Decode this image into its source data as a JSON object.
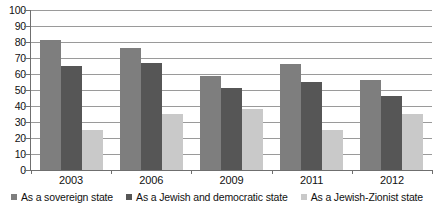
{
  "chart_data": {
    "type": "bar",
    "title": "",
    "subtitle": "",
    "xlabel": "",
    "ylabel": "",
    "categories": [
      "2003",
      "2006",
      "2009",
      "2011",
      "2012"
    ],
    "series": [
      {
        "name": "As a sovereign state",
        "color": "#7e7e7e",
        "values": [
          81,
          76,
          59,
          66,
          56
        ]
      },
      {
        "name": "As a Jewish and democratic state",
        "color": "#565656",
        "values": [
          65,
          67,
          51,
          55,
          46
        ]
      },
      {
        "name": "As a Jewish-Zionist state",
        "color": "#c9c9c9",
        "values": [
          25,
          35,
          38,
          25,
          35
        ]
      }
    ],
    "ylim": [
      0,
      100
    ],
    "ytick_step": 10,
    "yticks": [
      "100",
      "90",
      "80",
      "70",
      "60",
      "50",
      "40",
      "30",
      "20",
      "10",
      "0"
    ],
    "grid": true,
    "grid_axis": "y",
    "legend_position": "bottom"
  }
}
